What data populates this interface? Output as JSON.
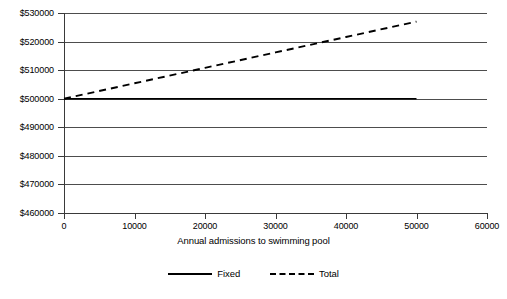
{
  "chart_data": {
    "type": "line",
    "title": "",
    "xlabel": "Annual admissions to swimming pool",
    "ylabel": "",
    "xlim": [
      0,
      60000
    ],
    "ylim": [
      460000,
      530000
    ],
    "grid": true,
    "legend_position": "bottom",
    "x_ticks": [
      0,
      10000,
      20000,
      30000,
      40000,
      50000,
      60000
    ],
    "x_tick_labels": [
      "0",
      "10000",
      "20000",
      "30000",
      "40000",
      "50000",
      "60000"
    ],
    "y_ticks": [
      460000,
      470000,
      480000,
      490000,
      500000,
      510000,
      520000,
      530000
    ],
    "y_tick_labels": [
      "$460000",
      "$470000",
      "$480000",
      "$490000",
      "$500000",
      "$510000",
      "$520000",
      "$530000"
    ],
    "series": [
      {
        "name": "Fixed",
        "style": "solid",
        "color": "#000000",
        "x": [
          0,
          10000,
          20000,
          30000,
          40000,
          50000
        ],
        "values": [
          500000,
          500000,
          500000,
          500000,
          500000,
          500000
        ]
      },
      {
        "name": "Total",
        "style": "dashed",
        "color": "#000000",
        "x": [
          0,
          10000,
          20000,
          30000,
          40000,
          50000
        ],
        "values": [
          500000,
          505400,
          510800,
          516200,
          521600,
          527000
        ]
      }
    ]
  },
  "legend": {
    "items": [
      {
        "label": "Fixed",
        "style": "solid"
      },
      {
        "label": "Total",
        "style": "dashed"
      }
    ]
  },
  "colors": {
    "gridline": "#4d4d4d",
    "axis": "#3a3a3a",
    "series": "#000000",
    "background": "#ffffff"
  }
}
